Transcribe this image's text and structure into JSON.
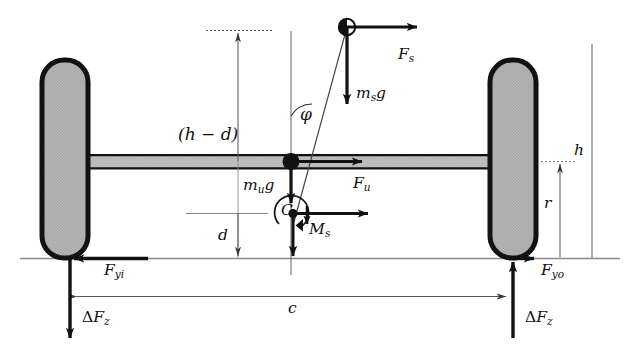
{
  "figure": {
    "type": "engineering-free-body-diagram",
    "width": 633,
    "height": 357,
    "background": "#ffffff",
    "stroke": "#111111",
    "wheel_fill": "#b3b3b3",
    "axle_fill": "#c0c0c0",
    "dimension_stroke": "#555555"
  },
  "labels": {
    "h_minus_d": {
      "text": "(h − d)",
      "base": "(h",
      "minus": "−",
      "tail": "d)"
    },
    "phi": "φ",
    "ms_g": {
      "base": "m",
      "sub": "s",
      "tail": "g"
    },
    "mu_g": {
      "base": "m",
      "sub": "u",
      "tail": "g"
    },
    "Fs": {
      "base": "F",
      "sub": "s"
    },
    "Fu": {
      "base": "F",
      "sub": "u"
    },
    "Ms": {
      "base": "M",
      "sub": "s"
    },
    "Fyi": {
      "base": "F",
      "sub": "yi"
    },
    "Fyo": {
      "base": "F",
      "sub": "yo"
    },
    "dFz_left": {
      "delta": "Δ",
      "base": "F",
      "sub": "z"
    },
    "dFz_right": {
      "delta": "Δ",
      "base": "F",
      "sub": "z"
    },
    "c": "c",
    "d": "d",
    "h": "h",
    "r": "r",
    "C": "C"
  },
  "geometry": {
    "ground_y": 258,
    "axle_top_y": 155,
    "axle_bottom_y": 168,
    "left_wheel": {
      "x": 42,
      "y": 60,
      "w": 46,
      "h": 198,
      "radius": 22
    },
    "right_wheel": {
      "x": 490,
      "y": 60,
      "w": 46,
      "h": 198,
      "radius": 22
    },
    "sprung_mass_node": {
      "x": 347,
      "y": 27
    },
    "unsprung_mass_node": {
      "x": 291,
      "y": 161
    },
    "roll_center_C": {
      "x": 293,
      "y": 213
    },
    "track_width_c": {
      "x1": 70,
      "x2": 513,
      "y": 296
    },
    "dim_h_minus_d_x": 238,
    "dim_h_x": 592,
    "dim_r_x": 560
  },
  "forces": [
    {
      "name": "F_s",
      "at": "sprung-mass",
      "direction": "right"
    },
    {
      "name": "m_s g",
      "at": "sprung-mass",
      "direction": "down"
    },
    {
      "name": "F_u",
      "at": "unsprung-mass",
      "direction": "right"
    },
    {
      "name": "m_u g",
      "at": "unsprung-mass",
      "direction": "down"
    },
    {
      "name": "M_s",
      "at": "roll-center",
      "direction": "down"
    },
    {
      "name": "F_yi",
      "at": "inner-contact-patch",
      "direction": "left"
    },
    {
      "name": "F_yo",
      "at": "outer-contact-patch",
      "direction": "right"
    },
    {
      "name": "ΔF_z inner",
      "at": "inner-contact-patch",
      "direction": "down"
    },
    {
      "name": "ΔF_z outer",
      "at": "outer-contact-patch",
      "direction": "up"
    }
  ],
  "dimensions": [
    {
      "name": "(h - d)",
      "from": "top-reference",
      "to": "axle-centerline"
    },
    {
      "name": "d",
      "from": "roll-center",
      "to": "ground"
    },
    {
      "name": "h",
      "from": "sprung-mass-height",
      "to": "ground"
    },
    {
      "name": "r",
      "from": "axle-centerline",
      "to": "ground"
    },
    {
      "name": "c",
      "from": "inner-contact-patch",
      "to": "outer-contact-patch"
    }
  ]
}
